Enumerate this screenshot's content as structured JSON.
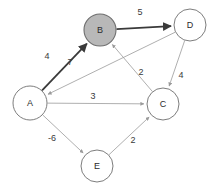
{
  "graph": {
    "type": "directed-weighted-graph",
    "background_color": "#ffffff",
    "default_node_fill": "#ffffff",
    "highlight_node_fill": "#b8b8b8",
    "default_edge_color": "#9a9a9a",
    "highlight_edge_color": "#3a3a3a",
    "node_stroke": "#6e6e6e",
    "nodes": [
      {
        "id": "A",
        "label": "A",
        "cx": 30,
        "cy": 103,
        "r": 17,
        "highlighted": false
      },
      {
        "id": "B",
        "label": "B",
        "cx": 100,
        "cy": 30,
        "r": 16,
        "highlighted": true
      },
      {
        "id": "C",
        "label": "C",
        "cx": 163,
        "cy": 104,
        "r": 16,
        "highlighted": false
      },
      {
        "id": "D",
        "label": "D",
        "cx": 190,
        "cy": 25,
        "r": 16,
        "highlighted": false
      },
      {
        "id": "E",
        "label": "E",
        "cx": 97,
        "cy": 166,
        "r": 16,
        "highlighted": false
      }
    ],
    "edges": [
      {
        "id": "A-B",
        "from": "A",
        "to": "B",
        "weight": "4",
        "label_x": 47,
        "label_y": 56,
        "highlighted": true
      },
      {
        "id": "B-D",
        "from": "B",
        "to": "D",
        "weight": "5",
        "label_x": 140,
        "label_y": 12,
        "highlighted": true
      },
      {
        "id": "D-A",
        "from": "D",
        "to": "A",
        "weight": "7",
        "label_x": 70,
        "label_y": 62,
        "highlighted": false
      },
      {
        "id": "C-B",
        "from": "C",
        "to": "B",
        "weight": "2",
        "label_x": 141,
        "label_y": 72,
        "highlighted": false
      },
      {
        "id": "D-C",
        "from": "D",
        "to": "C",
        "weight": "4",
        "label_x": 181,
        "label_y": 75,
        "highlighted": false
      },
      {
        "id": "A-C",
        "from": "A",
        "to": "C",
        "weight": "3",
        "label_x": 93,
        "label_y": 96,
        "highlighted": false
      },
      {
        "id": "A-E",
        "from": "A",
        "to": "E",
        "weight": "-6",
        "label_x": 52,
        "label_y": 138,
        "highlighted": false
      },
      {
        "id": "E-C",
        "from": "E",
        "to": "C",
        "weight": "2",
        "label_x": 133,
        "label_y": 140,
        "highlighted": false
      }
    ]
  }
}
